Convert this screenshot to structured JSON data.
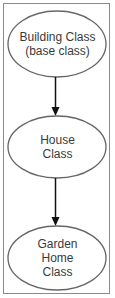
{
  "diagram": {
    "type": "class-hierarchy",
    "nodes": [
      {
        "id": "building",
        "line1": "Building Class",
        "line2": "(base class)"
      },
      {
        "id": "house",
        "line1": "House",
        "line2": "Class"
      },
      {
        "id": "garden",
        "line1": "Garden",
        "line2": "Home",
        "line3": "Class"
      }
    ],
    "edges": [
      {
        "from": "building",
        "to": "house"
      },
      {
        "from": "house",
        "to": "garden"
      }
    ],
    "colors": {
      "stroke": "#666666",
      "arrow": "#111111",
      "text": "#3a3a3a",
      "frame": "#8a8a8a"
    }
  }
}
